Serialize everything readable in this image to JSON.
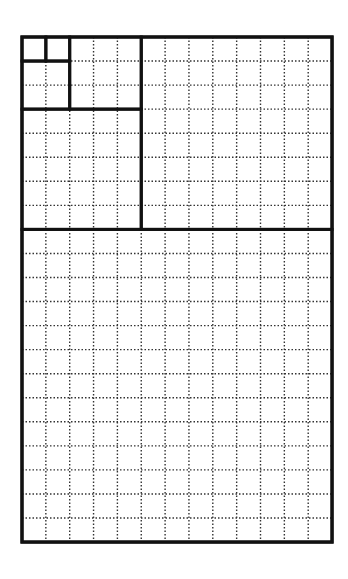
{
  "diagram": {
    "grid": {
      "columns": 13,
      "rows": 21
    },
    "origin": {
      "x": 22,
      "y": 37
    },
    "cell": {
      "w": 23.85,
      "h": 24.05
    },
    "colors": {
      "thick": "#111111",
      "dotted": "#333333",
      "background": "#ffffff"
    },
    "squares": [
      {
        "label": "1",
        "col": 0,
        "row": 0,
        "size": 1
      },
      {
        "label": "1",
        "col": 1,
        "row": 0,
        "size": 1
      },
      {
        "label": "2",
        "col": 0,
        "row": 1,
        "size": 2
      },
      {
        "label": "3",
        "col": 2,
        "row": 0,
        "size": 3
      },
      {
        "label": "5",
        "col": 0,
        "row": 3,
        "size": 5
      },
      {
        "label": "8",
        "col": 5,
        "row": 0,
        "size": 8
      },
      {
        "label": "13",
        "col": 0,
        "row": 8,
        "size": 13
      }
    ]
  }
}
